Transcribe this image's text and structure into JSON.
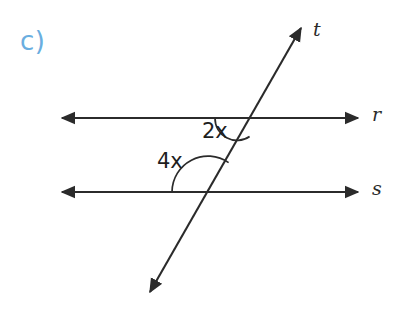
{
  "figure": {
    "problem_label": "c)",
    "background_color": "#ffffff",
    "stroke_color": "#2b2b2b",
    "accent_color": "#6aaee0",
    "lines": [
      {
        "name": "r",
        "label": "r",
        "type": "double-arrow-line",
        "orientation": "horizontal",
        "x1": 62,
        "y1": 118,
        "x2": 358,
        "y2": 118
      },
      {
        "name": "s",
        "label": "s",
        "type": "double-arrow-line",
        "orientation": "horizontal",
        "x1": 62,
        "y1": 192,
        "x2": 358,
        "y2": 192
      },
      {
        "name": "t",
        "label": "t",
        "type": "double-arrow-line",
        "orientation": "transversal",
        "x1": 150,
        "y1": 292,
        "x2": 301,
        "y2": 28
      }
    ],
    "intersections": [
      {
        "name": "r-t",
        "x": 237,
        "y": 118
      },
      {
        "name": "s-t",
        "x": 208,
        "y": 192
      }
    ],
    "angles": [
      {
        "name": "angle-2x",
        "label": "2x",
        "vertex": "r-t",
        "arc_radius": 22,
        "position": "below-left-of-transversal-at-line-r"
      },
      {
        "name": "angle-4x",
        "label": "4x",
        "vertex": "s-t",
        "arc_radius": 36,
        "position": "above-left-of-transversal-at-line-s"
      }
    ]
  }
}
